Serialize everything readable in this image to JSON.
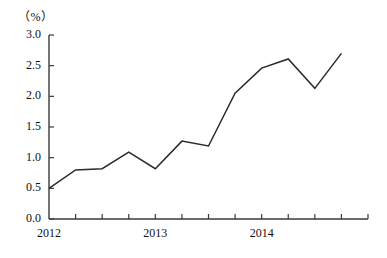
{
  "chart_data": {
    "type": "line",
    "title": "",
    "subtitle": "",
    "xlabel": "",
    "ylabel": "",
    "unit_label": "（%）",
    "x": [
      0,
      1,
      2,
      3,
      4,
      5,
      6,
      7,
      8,
      9,
      10,
      11
    ],
    "categories": [
      "2012",
      "",
      "",
      "",
      "2013",
      "",
      "",
      "",
      "2014",
      "",
      "",
      ""
    ],
    "values": [
      0.5,
      0.8,
      0.82,
      1.09,
      0.82,
      1.27,
      1.19,
      2.05,
      2.46,
      2.61,
      2.13,
      2.7
    ],
    "series": [
      {
        "name": "",
        "values": [
          0.5,
          0.8,
          0.82,
          1.09,
          0.82,
          1.27,
          1.19,
          2.05,
          2.46,
          2.61,
          2.13,
          2.7
        ]
      }
    ],
    "ylim": [
      0.0,
      3.0
    ],
    "ytick_labels": [
      "0.0",
      "0.5",
      "1.0",
      "1.5",
      "2.0",
      "2.5",
      "3.0"
    ],
    "ytick_values": [
      0.0,
      0.5,
      1.0,
      1.5,
      2.0,
      2.5,
      3.0
    ],
    "xtick_count": 12,
    "xtick_labels": [
      "2012",
      "2013",
      "2014"
    ],
    "xtick_label_positions": [
      0,
      4,
      8
    ],
    "grid": false,
    "legend": false,
    "legend_position": "none",
    "line_color": "#2b2b2b",
    "axis_color": "#3a3a3a",
    "background_color": "#ffffff"
  },
  "axes": {
    "plot_left": 49,
    "plot_right": 368,
    "plot_top": 35,
    "plot_bottom": 219
  }
}
